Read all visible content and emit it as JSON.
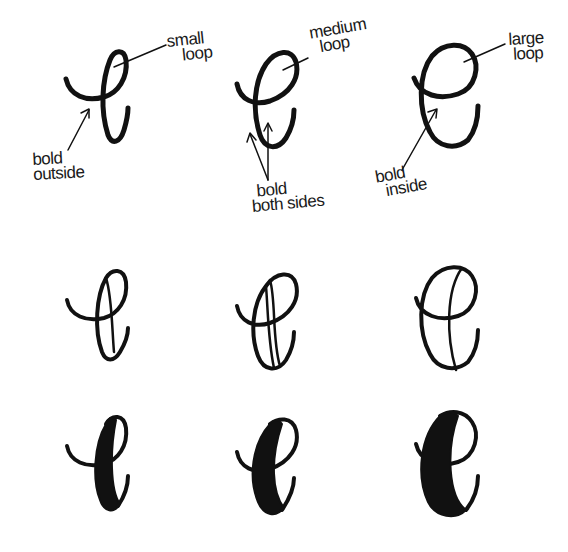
{
  "diagram": {
    "colors": {
      "ink": "#111111",
      "background": "#ffffff"
    },
    "row1": {
      "letters": [
        {
          "id": "small-loop-e",
          "loop_label": [
            "small",
            "loop"
          ],
          "bold_label": [
            "bold",
            "outside"
          ]
        },
        {
          "id": "medium-loop-e",
          "loop_label": [
            "medium",
            "loop"
          ],
          "bold_label": [
            "bold",
            "both sides"
          ]
        },
        {
          "id": "large-loop-e",
          "loop_label": [
            "large",
            "loop"
          ],
          "bold_label": [
            "bold",
            "inside"
          ]
        }
      ]
    },
    "row2": {
      "description": "outlined downstroke guides"
    },
    "row3": {
      "description": "filled bold downstrokes"
    }
  }
}
